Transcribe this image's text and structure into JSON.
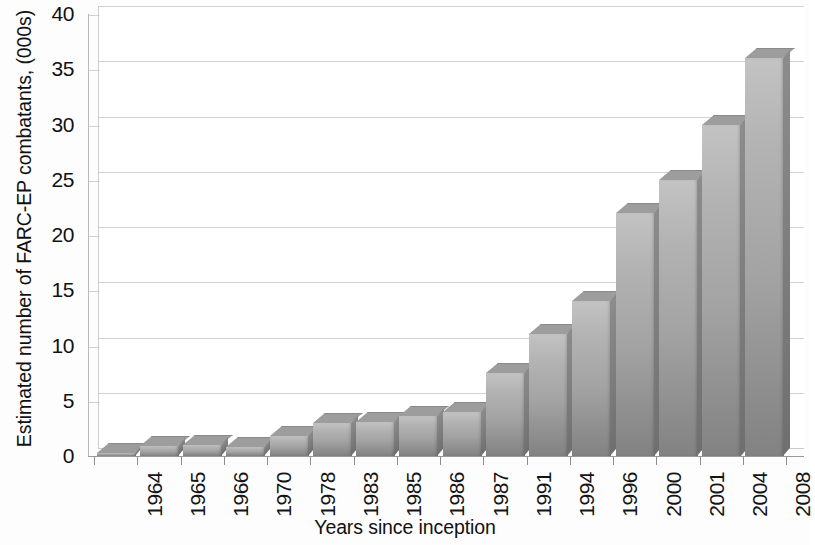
{
  "chart_data": {
    "type": "bar",
    "title": "",
    "xlabel": "Years since inception",
    "ylabel": "Estimated number of FARC-EP combatants, (000s)",
    "categories": [
      "1964",
      "1965",
      "1966",
      "1970",
      "1978",
      "1983",
      "1985",
      "1986",
      "1987",
      "1991",
      "1994",
      "1996",
      "2000",
      "2001",
      "2004",
      "2008"
    ],
    "values": [
      0.3,
      0.9,
      1.0,
      0.8,
      1.8,
      3.0,
      3.1,
      3.6,
      4.0,
      7.5,
      11.0,
      14.0,
      22.0,
      25.0,
      30.0,
      36.0
    ],
    "ylim": [
      0,
      40
    ],
    "ytick_labels": [
      "0",
      "5",
      "10",
      "15",
      "20",
      "25",
      "30",
      "35",
      "40"
    ],
    "ytick_values": [
      0,
      5,
      10,
      15,
      20,
      25,
      30,
      35,
      40
    ],
    "grid": true,
    "legend": "none",
    "series": [
      {
        "name": "Estimated FARC-EP combatants",
        "values": [
          0.3,
          0.9,
          1.0,
          0.8,
          1.8,
          3.0,
          3.1,
          3.6,
          4.0,
          7.5,
          11.0,
          14.0,
          22.0,
          25.0,
          30.0,
          36.0
        ]
      }
    ],
    "colors": {
      "bar_top": "#c3c3c3",
      "bar_bottom": "#828282",
      "grid": "#c9c9c9",
      "axis": "#9a9a9a",
      "text": "#111111",
      "background": "#fdfdfd"
    },
    "style": "3d-column"
  }
}
